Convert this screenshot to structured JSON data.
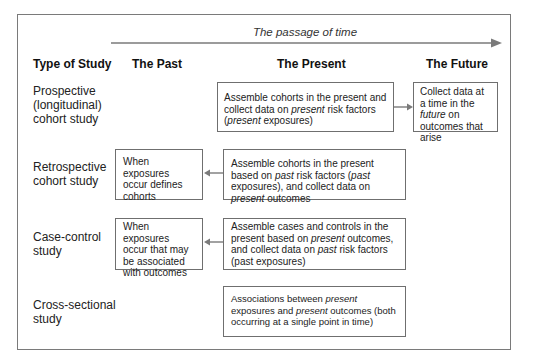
{
  "timeline": {
    "label": "The passage of time",
    "arrow_direction": "right",
    "color": "#7a7a7a"
  },
  "headers": {
    "type": "Type of Study",
    "past": "The Past",
    "present": "The Present",
    "future": "The Future"
  },
  "rows": [
    {
      "label_lines": [
        "Prospective",
        "(longitudinal)",
        "cohort study"
      ],
      "present": {
        "segments": [
          {
            "t": "Assemble cohorts in the present and collect data on "
          },
          {
            "t": "present",
            "i": true
          },
          {
            "t": " risk factors ("
          },
          {
            "t": "present",
            "i": true
          },
          {
            "t": " exposures)"
          }
        ]
      },
      "future": {
        "segments": [
          {
            "t": "Collect data at a time in the "
          },
          {
            "t": "future",
            "i": true
          },
          {
            "t": " on outcomes that arise"
          }
        ]
      },
      "arrow": "present-to-future"
    },
    {
      "label_lines": [
        "Retrospective",
        "cohort study"
      ],
      "past": {
        "segments": [
          {
            "t": "When exposures occur defines cohorts"
          }
        ]
      },
      "present": {
        "segments": [
          {
            "t": "Assemble cohorts in the present based on "
          },
          {
            "t": "past",
            "i": true
          },
          {
            "t": " risk factors ("
          },
          {
            "t": "past",
            "i": true
          },
          {
            "t": " exposures), and collect data on "
          },
          {
            "t": "present",
            "i": true
          },
          {
            "t": " outcomes"
          }
        ]
      },
      "arrow": "present-to-past"
    },
    {
      "label_lines": [
        "Case-control",
        "study"
      ],
      "past": {
        "segments": [
          {
            "t": "When exposures occur that may be associated with outcomes"
          }
        ]
      },
      "present": {
        "segments": [
          {
            "t": "Assemble cases and controls in the present based on "
          },
          {
            "t": "present",
            "i": true
          },
          {
            "t": " outcomes, and collect data on "
          },
          {
            "t": "past",
            "i": true
          },
          {
            "t": " risk factors (past exposures)"
          }
        ]
      },
      "arrow": "present-to-past"
    },
    {
      "label_lines": [
        "Cross-sectional",
        "study"
      ],
      "present": {
        "segments": [
          {
            "t": "Associations between "
          },
          {
            "t": "present",
            "i": true
          },
          {
            "t": " exposures and "
          },
          {
            "t": "present",
            "i": true
          },
          {
            "t": " outcomes (both occurring at a single point in time)"
          }
        ]
      }
    }
  ]
}
